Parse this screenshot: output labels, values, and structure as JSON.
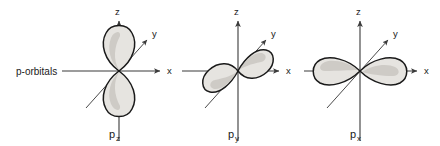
{
  "figure": {
    "title": "p-orbitals",
    "row_label": "p-orbitals",
    "background_color": "#ffffff",
    "line_color": "#3a3a3a",
    "lobe_fill_color": "#e6e4e0",
    "lobe_stroke_color": "#1a1a1a"
  },
  "axes": {
    "z_label": "z",
    "y_label": "y",
    "x_label": "x"
  },
  "orbitals": [
    {
      "name_base": "p",
      "name_sub": "z",
      "name_full": "pz",
      "lobe_orientation": "vertical",
      "lobe_axis": "z",
      "axis_labels": {
        "z": "z",
        "y": "y",
        "x": "x"
      }
    },
    {
      "name_base": "p",
      "name_sub": "y",
      "name_full": "py",
      "lobe_orientation": "diagonal",
      "lobe_axis": "y",
      "axis_labels": {
        "z": "z",
        "y": "y",
        "x": "x"
      }
    },
    {
      "name_base": "p",
      "name_sub": "x",
      "name_full": "px",
      "lobe_orientation": "horizontal",
      "lobe_axis": "x",
      "axis_labels": {
        "z": "z",
        "y": "y",
        "x": "x"
      }
    }
  ]
}
